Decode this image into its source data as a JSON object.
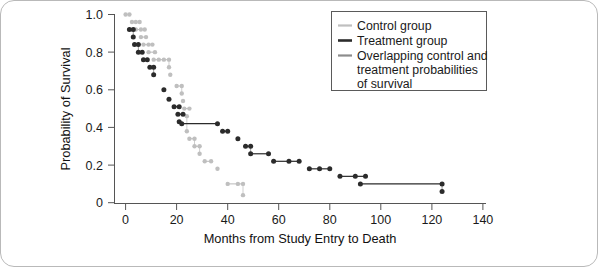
{
  "chart_data": {
    "type": "line",
    "title": "",
    "xlabel": "Months from Study Entry to Death",
    "ylabel": "Probability of Survival",
    "xlim": [
      0,
      140
    ],
    "ylim": [
      0,
      1.0
    ],
    "xticks": [
      0,
      20,
      40,
      60,
      80,
      100,
      120,
      140
    ],
    "xtick_labels": [
      "0",
      "20",
      "40",
      "60",
      "80",
      "100",
      "120",
      "140"
    ],
    "yticks": [
      0,
      0.2,
      0.4,
      0.6,
      0.8,
      1.0
    ],
    "ytick_labels": [
      "0",
      "0.2",
      "0.4",
      "0.6",
      "0.8",
      "1.0"
    ],
    "grid": false,
    "legend_position": "top-right",
    "series": [
      {
        "name": "Control group",
        "color": "#bfbfbf",
        "marker": "circle",
        "points": [
          [
            0,
            1.0
          ],
          [
            1.5,
            1.0
          ],
          [
            2.5,
            0.96
          ],
          [
            4,
            0.96
          ],
          [
            5.5,
            0.96
          ],
          [
            4,
            0.92
          ],
          [
            6,
            0.92
          ],
          [
            7.5,
            0.92
          ],
          [
            6,
            0.88
          ],
          [
            8,
            0.88
          ],
          [
            7,
            0.84
          ],
          [
            9,
            0.84
          ],
          [
            10.5,
            0.84
          ],
          [
            9,
            0.8
          ],
          [
            11.5,
            0.8
          ],
          [
            11,
            0.76
          ],
          [
            13,
            0.76
          ],
          [
            15,
            0.76
          ],
          [
            17,
            0.76
          ],
          [
            17,
            0.72
          ],
          [
            17.5,
            0.68
          ],
          [
            20,
            0.62
          ],
          [
            22,
            0.62
          ],
          [
            22,
            0.58
          ],
          [
            22.5,
            0.54
          ],
          [
            23,
            0.5
          ],
          [
            25,
            0.5
          ],
          [
            24,
            0.46
          ],
          [
            24,
            0.38
          ],
          [
            25,
            0.34
          ],
          [
            27,
            0.34
          ],
          [
            27,
            0.3
          ],
          [
            29,
            0.3
          ],
          [
            29,
            0.26
          ],
          [
            31,
            0.22
          ],
          [
            33.5,
            0.22
          ],
          [
            36,
            0.18
          ],
          [
            40,
            0.1
          ],
          [
            44,
            0.1
          ],
          [
            46,
            0.1
          ],
          [
            46,
            0.04
          ]
        ]
      },
      {
        "name": "Treatment group",
        "color": "#2b2b2b",
        "marker": "circle",
        "points": [
          [
            1.5,
            0.92
          ],
          [
            3,
            0.92
          ],
          [
            3,
            0.88
          ],
          [
            3.5,
            0.84
          ],
          [
            5,
            0.84
          ],
          [
            5,
            0.8
          ],
          [
            6.5,
            0.8
          ],
          [
            7,
            0.76
          ],
          [
            8.5,
            0.76
          ],
          [
            9.5,
            0.72
          ],
          [
            11,
            0.72
          ],
          [
            11,
            0.68
          ],
          [
            15,
            0.6
          ],
          [
            17,
            0.55
          ],
          [
            19,
            0.51
          ],
          [
            21,
            0.51
          ],
          [
            20.5,
            0.47
          ],
          [
            22.5,
            0.47
          ],
          [
            21,
            0.43
          ],
          [
            22,
            0.42
          ],
          [
            36,
            0.42
          ],
          [
            38,
            0.38
          ],
          [
            40,
            0.38
          ],
          [
            44,
            0.34
          ],
          [
            47,
            0.3
          ],
          [
            49,
            0.3
          ],
          [
            49,
            0.26
          ],
          [
            56,
            0.26
          ],
          [
            58,
            0.22
          ],
          [
            64,
            0.22
          ],
          [
            68,
            0.22
          ],
          [
            72,
            0.18
          ],
          [
            76,
            0.18
          ],
          [
            80,
            0.18
          ],
          [
            84,
            0.14
          ],
          [
            90,
            0.14
          ],
          [
            94,
            0.14
          ],
          [
            92,
            0.1
          ],
          [
            124,
            0.1
          ],
          [
            124,
            0.06
          ]
        ]
      },
      {
        "name": "Overlapping control and treatment probabilities of survival",
        "color": "#8c8c8c",
        "marker": "none",
        "points": []
      }
    ],
    "legend_entries": [
      {
        "label": "Control group",
        "color": "#bfbfbf"
      },
      {
        "label": "Treatment group",
        "color": "#2b2b2b"
      },
      {
        "label": "Overlapping control and",
        "color": "#8c8c8c"
      },
      {
        "label": "treatment probabilities",
        "color": null
      },
      {
        "label": "of survival",
        "color": null
      }
    ]
  },
  "axes": {
    "ylabel": "Probability of Survival",
    "xlabel": "Months from Study Entry to Death",
    "xticks": [
      "0",
      "20",
      "40",
      "60",
      "80",
      "100",
      "120",
      "140"
    ],
    "yticks": [
      "1.0",
      "0.8",
      "0.6",
      "0.4",
      "0.2",
      "0"
    ]
  },
  "legend": {
    "lines": [
      "Control group",
      "Treatment group",
      "Overlapping control and",
      "treatment probabilities",
      "of survival"
    ]
  },
  "colors": {
    "control": "#bfbfbf",
    "treatment": "#2b2b2b",
    "overlap": "#8c8c8c",
    "axis": "#555555",
    "text": "#1a1a1a",
    "page_border": "#b9b9b9"
  }
}
